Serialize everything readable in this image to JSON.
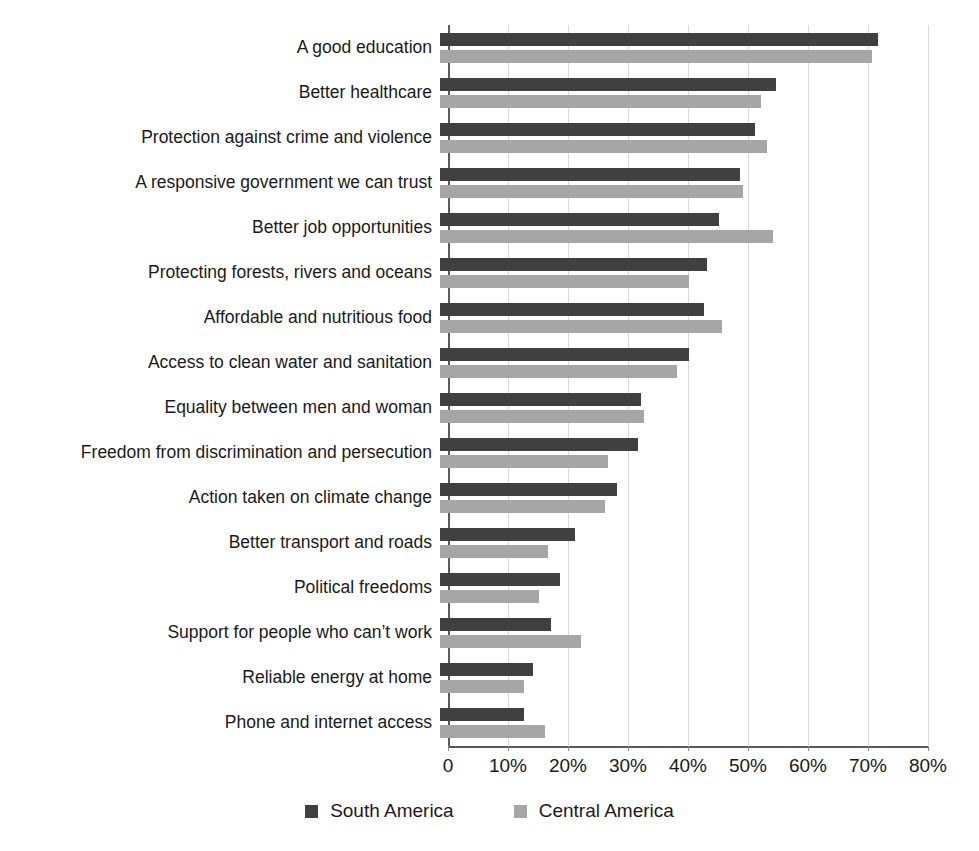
{
  "chart_data": {
    "type": "bar",
    "orientation": "horizontal",
    "title": "",
    "xlabel": "",
    "ylabel": "",
    "xlim": [
      0,
      80
    ],
    "xticks": [
      0,
      10,
      20,
      30,
      40,
      50,
      60,
      70,
      80
    ],
    "xtick_labels": [
      "0",
      "10%",
      "20%",
      "30%",
      "40%",
      "50%",
      "60%",
      "70%",
      "80%"
    ],
    "grid": true,
    "legend_position": "bottom-center",
    "categories": [
      "A good education",
      "Better healthcare",
      "Protection against crime and violence",
      "A responsive government we can trust",
      "Better job opportunities",
      "Protecting forests, rivers and oceans",
      "Affordable and nutritious food",
      "Access to clean water and sanitation",
      "Equality between men and woman",
      "Freedom from discrimination and persecution",
      "Action taken on climate change",
      "Better transport and roads",
      "Political freedoms",
      "Support for people who can’t work",
      "Reliable energy at home",
      "Phone and internet access"
    ],
    "series": [
      {
        "name": "South America",
        "color": "#404040",
        "values": [
          73,
          56,
          52.5,
          50,
          46.5,
          44.5,
          44,
          41.5,
          33.5,
          33,
          29.5,
          22.5,
          20,
          18.5,
          15.5,
          14
        ]
      },
      {
        "name": "Central America",
        "color": "#a6a6a6",
        "values": [
          72,
          53.5,
          54.5,
          50.5,
          55.5,
          41.5,
          47,
          39.5,
          34,
          28,
          27.5,
          18,
          16.5,
          23.5,
          14,
          17.5
        ]
      }
    ]
  },
  "legend": {
    "items": [
      {
        "label": "South America",
        "color": "#404040"
      },
      {
        "label": "Central America",
        "color": "#a6a6a6"
      }
    ]
  }
}
